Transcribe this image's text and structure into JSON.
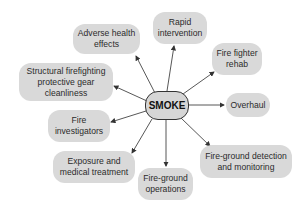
{
  "diagram": {
    "type": "hub-and-spoke",
    "center": {
      "label": "SMOKE"
    },
    "nodes": [
      {
        "id": "adverse",
        "label": "Adverse health effects"
      },
      {
        "id": "rapid",
        "label": "Rapid intervention"
      },
      {
        "id": "rehab",
        "label": "Fire fighter rehab"
      },
      {
        "id": "structural",
        "label": "Structural firefighting protective gear cleanliness"
      },
      {
        "id": "overhaul",
        "label": "Overhaul"
      },
      {
        "id": "investigators",
        "label": "Fire investigators"
      },
      {
        "id": "exposure",
        "label": "Exposure and medical treatment"
      },
      {
        "id": "operations",
        "label": "Fire-ground operations"
      },
      {
        "id": "detection",
        "label": "Fire-ground detection and monitoring"
      }
    ],
    "colors": {
      "node_fill": "#d9d9d9",
      "arrow": "#333333",
      "center_border": "#333333"
    }
  }
}
